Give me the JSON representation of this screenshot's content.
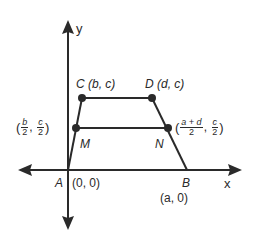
{
  "figure": {
    "type": "coordinate-geometry-trapezoid",
    "colors": {
      "stroke": "#2a2a2a",
      "background": "#ffffff"
    },
    "axes": {
      "x_label": "x",
      "y_label": "y"
    },
    "points": {
      "A": {
        "name": "A",
        "coords": "(0, 0)"
      },
      "B": {
        "name": "B",
        "coords": "(a, 0)"
      },
      "C": {
        "name": "C",
        "coords": "(b, c)"
      },
      "D": {
        "name": "D",
        "coords": "(d, c)"
      },
      "M": {
        "name": "M",
        "coord_x_num": "b",
        "coord_x_den": "2",
        "coord_y_num": "c",
        "coord_y_den": "2"
      },
      "N": {
        "name": "N",
        "coord_x_num": "a + d",
        "coord_x_den": "2",
        "coord_y_num": "c",
        "coord_y_den": "2"
      }
    },
    "punct": {
      "open": "(",
      "close": ")",
      "comma": ","
    }
  }
}
